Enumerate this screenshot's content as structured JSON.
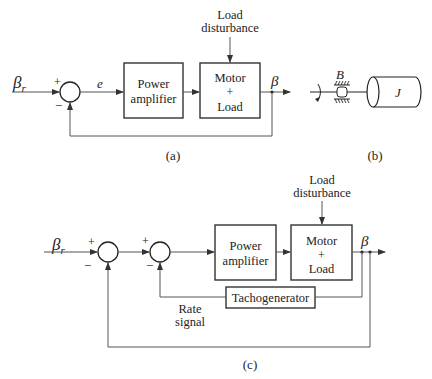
{
  "figure_a": {
    "input_label": "βr",
    "input_symbol": "β",
    "input_subscript": "r",
    "sum_plus": "+",
    "sum_minus": "−",
    "error_label": "e",
    "power_amplifier": [
      "Power",
      "amplifier"
    ],
    "motor_load": [
      "Motor",
      "+",
      "Load"
    ],
    "disturbance": [
      "Load",
      "disturbance"
    ],
    "output_label": "β",
    "caption": "(a)"
  },
  "figure_b": {
    "damping_label": "B",
    "inertia_label": "J",
    "caption": "(b)"
  },
  "figure_c": {
    "input_symbol": "β",
    "input_subscript": "r",
    "sum1_plus": "+",
    "sum1_minus": "−",
    "sum2_plus": "+",
    "sum2_minus": "−",
    "power_amplifier": [
      "Power",
      "amplifier"
    ],
    "motor_load": [
      "Motor",
      "+",
      "Load"
    ],
    "disturbance": [
      "Load",
      "disturbance"
    ],
    "tachogenerator": "Tachogenerator",
    "rate_signal": [
      "Rate",
      "signal"
    ],
    "output_label": "β",
    "caption": "(c)"
  }
}
